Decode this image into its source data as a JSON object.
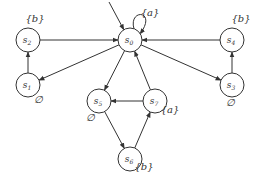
{
  "diagram": {
    "type": "state-transition-graph",
    "colors": {
      "stroke": "#333333",
      "background": "#ffffff"
    },
    "nodes": [
      {
        "id": "s0",
        "name": "s",
        "sub": "0",
        "x": 130,
        "y": 40,
        "label": "{a}",
        "label_x": 150,
        "label_y": 16
      },
      {
        "id": "s1",
        "name": "s",
        "sub": "1",
        "x": 28,
        "y": 85,
        "label": "∅",
        "label_x": 38,
        "label_y": 103
      },
      {
        "id": "s2",
        "name": "s",
        "sub": "2",
        "x": 28,
        "y": 40,
        "label": "{b}",
        "label_x": 35,
        "label_y": 22
      },
      {
        "id": "s3",
        "name": "s",
        "sub": "3",
        "x": 232,
        "y": 85,
        "label": "∅",
        "label_x": 230,
        "label_y": 106
      },
      {
        "id": "s4",
        "name": "s",
        "sub": "4",
        "x": 232,
        "y": 40,
        "label": "{b}",
        "label_x": 241,
        "label_y": 22
      },
      {
        "id": "s5",
        "name": "s",
        "sub": "5",
        "x": 99,
        "y": 101,
        "label": "∅",
        "label_x": 90,
        "label_y": 121
      },
      {
        "id": "s6",
        "name": "s",
        "sub": "6",
        "x": 130,
        "y": 159,
        "label": "{b}",
        "label_x": 144,
        "label_y": 170
      },
      {
        "id": "s7",
        "name": "s",
        "sub": "7",
        "x": 155,
        "y": 101,
        "label": "{a}",
        "label_x": 170,
        "label_y": 113
      }
    ],
    "edges": [
      {
        "from": "init",
        "to": "s0"
      },
      {
        "from": "s0",
        "to": "s0",
        "self_loop": true
      },
      {
        "from": "s2",
        "to": "s0"
      },
      {
        "from": "s0",
        "to": "s1"
      },
      {
        "from": "s1",
        "to": "s2"
      },
      {
        "from": "s4",
        "to": "s0"
      },
      {
        "from": "s0",
        "to": "s3"
      },
      {
        "from": "s3",
        "to": "s4"
      },
      {
        "from": "s0",
        "to": "s5"
      },
      {
        "from": "s7",
        "to": "s0"
      },
      {
        "from": "s7",
        "to": "s5"
      },
      {
        "from": "s5",
        "to": "s6"
      },
      {
        "from": "s6",
        "to": "s7"
      }
    ]
  }
}
